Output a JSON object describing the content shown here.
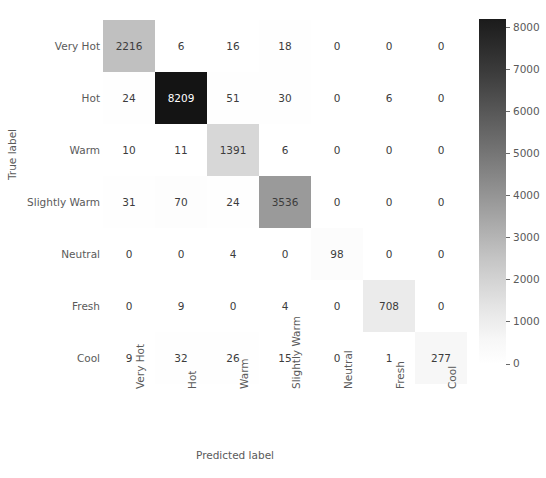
{
  "chart_data": {
    "type": "heatmap",
    "title": "",
    "xlabel": "Predicted label",
    "ylabel": "True label",
    "categories": [
      "Very Hot",
      "Hot",
      "Warm",
      "Slightly Warm",
      "Neutral",
      "Fresh",
      "Cool"
    ],
    "row_labels": [
      "Very Hot",
      "Hot",
      "Warm",
      "Slightly Warm",
      "Neutral",
      "Fresh",
      "Cool"
    ],
    "col_labels": [
      "Very Hot",
      "Hot",
      "Warm",
      "Slightly Warm",
      "Neutral",
      "Fresh",
      "Cool"
    ],
    "matrix": [
      [
        2216,
        6,
        16,
        18,
        0,
        0,
        0
      ],
      [
        24,
        8209,
        51,
        30,
        0,
        6,
        0
      ],
      [
        10,
        11,
        1391,
        6,
        0,
        0,
        0
      ],
      [
        31,
        70,
        24,
        3536,
        0,
        0,
        0
      ],
      [
        0,
        0,
        4,
        0,
        98,
        0,
        0
      ],
      [
        0,
        9,
        0,
        4,
        0,
        708,
        0
      ],
      [
        9,
        32,
        26,
        15,
        0,
        1,
        277
      ]
    ],
    "colorbar": {
      "ticks": [
        8000,
        7000,
        6000,
        5000,
        4000,
        3000,
        2000,
        1000,
        0
      ],
      "tick_labels": [
        "8000",
        "7000",
        "6000",
        "5000",
        "4000",
        "3000",
        "2000",
        "1000",
        "0"
      ],
      "vmin": 0,
      "vmax": 8209,
      "colormap": "greys",
      "position": "right",
      "low_color": "#ffffff",
      "high_color": "#1b1b1b"
    },
    "grid": false,
    "text_color_dark": "#3c3c3c",
    "text_color_light": "#ffffff"
  }
}
